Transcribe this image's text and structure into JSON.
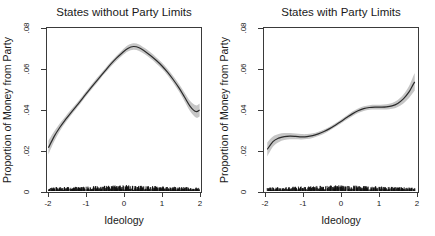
{
  "figure": {
    "background_color": "#ffffff",
    "ribbon_color": "#c6c6c6",
    "line_color": "#2b2b2b",
    "rug_color": "#111111",
    "axis_color": "#3a3a3a"
  },
  "chart_data": [
    {
      "type": "line",
      "panel_index": 0,
      "title": "States without Party Limits",
      "xlabel": "Ideology",
      "ylabel": "Proportion of Money from Party",
      "xlim": [
        -2.05,
        2.05
      ],
      "ylim": [
        0,
        0.085
      ],
      "xticks": [
        -2,
        -1,
        0,
        1,
        2
      ],
      "xticklabels": [
        "-2",
        "-1",
        "0",
        "1",
        "2"
      ],
      "yticks": [
        0,
        0.02,
        0.04,
        0.06,
        0.08
      ],
      "yticklabels": [
        "0",
        ".02",
        ".04",
        ".06",
        ".08"
      ],
      "grid": false,
      "legend": "none",
      "series": [
        {
          "name": "LOESS fit",
          "x": [
            -2.0,
            -1.85,
            -1.7,
            -1.55,
            -1.4,
            -1.25,
            -1.1,
            -0.95,
            -0.8,
            -0.65,
            -0.5,
            -0.35,
            -0.2,
            -0.05,
            0.1,
            0.25,
            0.4,
            0.55,
            0.7,
            0.85,
            1.0,
            1.15,
            1.3,
            1.45,
            1.6,
            1.75,
            1.9,
            2.0
          ],
          "values": [
            0.023,
            0.0288,
            0.0335,
            0.0375,
            0.0412,
            0.0447,
            0.0484,
            0.0521,
            0.0557,
            0.0592,
            0.0627,
            0.0661,
            0.0692,
            0.0719,
            0.0742,
            0.0752,
            0.0746,
            0.0728,
            0.0706,
            0.0681,
            0.0653,
            0.062,
            0.0582,
            0.054,
            0.0492,
            0.0444,
            0.0417,
            0.0425
          ],
          "ci_lower": [
            0.0196,
            0.0262,
            0.0315,
            0.0359,
            0.0398,
            0.0434,
            0.0472,
            0.0509,
            0.0545,
            0.058,
            0.0615,
            0.0648,
            0.0678,
            0.0704,
            0.0726,
            0.0735,
            0.0729,
            0.0712,
            0.069,
            0.0665,
            0.0637,
            0.0604,
            0.0565,
            0.0521,
            0.047,
            0.0418,
            0.0386,
            0.0392
          ],
          "ci_upper": [
            0.0266,
            0.0314,
            0.0356,
            0.0392,
            0.0427,
            0.0461,
            0.0497,
            0.0534,
            0.057,
            0.0605,
            0.0639,
            0.0674,
            0.0705,
            0.0733,
            0.0758,
            0.0769,
            0.0763,
            0.0744,
            0.0722,
            0.0697,
            0.067,
            0.0637,
            0.06,
            0.056,
            0.0515,
            0.0471,
            0.0449,
            0.0459
          ]
        },
        {
          "name": "Observations (rug)",
          "description": "Dense band of observed data points near y = 0 across the full ideology range",
          "y_value": 0.0008,
          "x_range": [
            -2.0,
            2.0
          ],
          "n_points": 480
        }
      ]
    },
    {
      "type": "line",
      "panel_index": 1,
      "title": "States with Party Limits",
      "xlabel": "Ideology",
      "ylabel": "Proportion of Money from Party",
      "xlim": [
        -2.05,
        2.05
      ],
      "ylim": [
        0,
        0.085
      ],
      "xticks": [
        -2,
        -1,
        0,
        1,
        2
      ],
      "xticklabels": [
        "-2",
        "-1",
        "0",
        "1",
        "2"
      ],
      "yticks": [
        0,
        0.02,
        0.04,
        0.06,
        0.08
      ],
      "yticklabels": [
        "0",
        ".02",
        ".04",
        ".06",
        ".08"
      ],
      "grid": false,
      "legend": "none",
      "series": [
        {
          "name": "LOESS fit",
          "x": [
            -1.95,
            -1.8,
            -1.65,
            -1.5,
            -1.35,
            -1.2,
            -1.05,
            -0.9,
            -0.75,
            -0.6,
            -0.45,
            -0.3,
            -0.15,
            0.0,
            0.15,
            0.3,
            0.45,
            0.6,
            0.75,
            0.9,
            1.05,
            1.2,
            1.35,
            1.5,
            1.65,
            1.8,
            1.9,
            1.95
          ],
          "values": [
            0.0222,
            0.0262,
            0.028,
            0.0288,
            0.029,
            0.0289,
            0.0287,
            0.0288,
            0.0293,
            0.0302,
            0.0314,
            0.0329,
            0.0347,
            0.0366,
            0.0386,
            0.0405,
            0.0421,
            0.0432,
            0.0438,
            0.044,
            0.044,
            0.0441,
            0.0446,
            0.0459,
            0.0482,
            0.0518,
            0.0553,
            0.057
          ],
          "ci_lower": [
            0.0186,
            0.0236,
            0.0259,
            0.027,
            0.0274,
            0.0274,
            0.0273,
            0.0275,
            0.0281,
            0.0291,
            0.0303,
            0.0319,
            0.0337,
            0.0356,
            0.0375,
            0.0393,
            0.0409,
            0.042,
            0.0426,
            0.0428,
            0.0428,
            0.0428,
            0.0431,
            0.0441,
            0.0459,
            0.0487,
            0.0512,
            0.0524
          ],
          "ci_upper": [
            0.0258,
            0.0288,
            0.0301,
            0.0306,
            0.0306,
            0.0304,
            0.0301,
            0.0301,
            0.0305,
            0.0313,
            0.0325,
            0.0339,
            0.0357,
            0.0376,
            0.0397,
            0.0417,
            0.0433,
            0.0444,
            0.045,
            0.0452,
            0.0452,
            0.0454,
            0.0461,
            0.0477,
            0.0505,
            0.0549,
            0.0594,
            0.0616
          ]
        },
        {
          "name": "Observations (rug)",
          "description": "Dense band of observed data points near y = 0 across the full ideology range",
          "y_value": 0.0008,
          "x_range": [
            -1.95,
            1.95
          ],
          "n_points": 420
        }
      ]
    }
  ]
}
